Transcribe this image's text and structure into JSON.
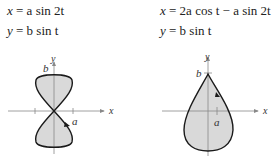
{
  "left": {
    "eq1": {
      "lhs": "x",
      "rhs": "= a sin 2t"
    },
    "eq2": {
      "lhs": "y",
      "rhs": "= b sin t"
    },
    "axis_x": "x",
    "axis_y": "y",
    "label_a": "a",
    "label_b": "b"
  },
  "right": {
    "eq1": {
      "lhs": "x",
      "rhs": "= 2a cos t − a sin 2t"
    },
    "eq2": {
      "lhs": "y",
      "rhs": "= b sin t"
    },
    "axis_x": "x",
    "axis_y": "y",
    "label_a": "a",
    "label_b": "b"
  },
  "colors": {
    "fill": "#d9d9d9",
    "curve": "#1a1a1a",
    "axis": "#888888"
  }
}
